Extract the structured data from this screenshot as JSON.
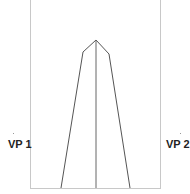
{
  "diagram": {
    "type": "two-point perspective construction",
    "labels": {
      "vp1": "VP 1",
      "vp2": "VP 2"
    },
    "colors": {
      "frame": "#c8c8c8",
      "lines": "#555555",
      "text": "#222222"
    },
    "frame": {
      "left": 30,
      "right": 160,
      "bottom": 188
    },
    "shape": {
      "apex": [
        96,
        40
      ],
      "left_shoulder": [
        83,
        52
      ],
      "right_shoulder": [
        109,
        54
      ],
      "left_base": [
        61,
        188
      ],
      "right_base": [
        130,
        188
      ],
      "center_base": [
        96,
        188
      ]
    }
  }
}
